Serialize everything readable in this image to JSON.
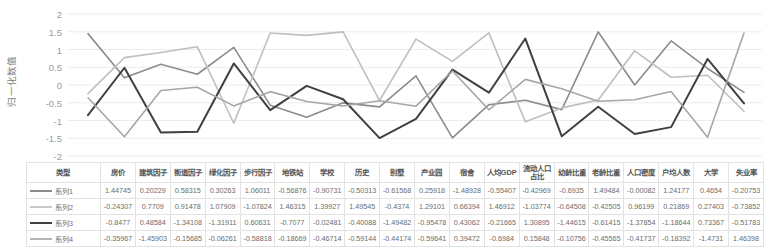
{
  "chart_data": {
    "type": "line",
    "title": "",
    "xlabel": "",
    "ylabel": "归一化数值",
    "ylim": [
      -2,
      2
    ],
    "yticks": [
      "2",
      "1.5",
      "1",
      "0.5",
      "0",
      "-0.5",
      "-1",
      "-1.5",
      "-2"
    ],
    "grid": true,
    "legend_position": "table",
    "categories": [
      "房价",
      "建筑因子",
      "街道因子",
      "绿化因子",
      "步行因子",
      "地铁站",
      "学校",
      "历史",
      "别墅",
      "产业园",
      "宿舍",
      "人均GDP",
      "流动人口占比",
      "幼龄比重",
      "老龄比重",
      "人口密度",
      "户均人数",
      "大学",
      "失业率"
    ],
    "series": [
      {
        "name": "系列1",
        "color": "#8c8c8c",
        "width": 1.6,
        "values": [
          1.44745,
          0.20229,
          0.58315,
          0.30263,
          1.06011,
          -0.56876,
          -0.90731,
          -0.50313,
          -0.61568,
          0.25918,
          -1.48928,
          -0.55407,
          -0.42969,
          -0.6935,
          1.49484,
          -0.00082,
          1.24177,
          0.4654,
          -0.20753
        ]
      },
      {
        "name": "系列2",
        "color": "#bfbfbf",
        "width": 1.6,
        "values": [
          -0.24307,
          0.7709,
          0.91478,
          1.07909,
          -1.07824,
          1.46315,
          1.39927,
          1.49545,
          -0.4374,
          1.29101,
          0.66394,
          1.46912,
          -1.03774,
          -0.64508,
          -0.42505,
          0.96199,
          0.21869,
          0.27403,
          -0.73852
        ]
      },
      {
        "name": "系列3",
        "color": "#404040",
        "width": 2.0,
        "values": [
          -0.8477,
          0.48584,
          -1.34108,
          -1.31911,
          0.60631,
          -0.7077,
          -0.02481,
          -0.40088,
          -1.49482,
          -0.95478,
          0.43062,
          -0.21665,
          1.30895,
          -1.44615,
          -0.61415,
          -1.37854,
          -1.18644,
          0.73367,
          -0.51783
        ]
      },
      {
        "name": "系列4",
        "color": "#a6a6a6",
        "width": 1.6,
        "values": [
          -0.35967,
          -1.45903,
          -0.15685,
          -0.06261,
          -0.58818,
          -0.18669,
          -0.46714,
          -0.59144,
          -0.44174,
          -0.59641,
          0.39472,
          -0.6984,
          0.15848,
          -0.10756,
          -0.45565,
          -0.41737,
          -0.18392,
          -1.4731,
          1.46398
        ]
      }
    ]
  },
  "table": {
    "type_header": "类型",
    "headers": [
      "房价",
      "建筑因子",
      "街道因子",
      "绿化因子",
      "步行因子",
      "地铁站",
      "学校",
      "历史",
      "别墅",
      "产业园",
      "宿舍",
      "人均GDP",
      "流动人口占比",
      "幼龄比重",
      "老龄比重",
      "人口密度",
      "户均人数",
      "大学",
      "失业率"
    ],
    "rows": [
      {
        "label": "系列1",
        "color": "#8c8c8c",
        "width": 2,
        "cells": [
          "1.44745",
          "0.20229",
          "0.58315",
          "0.30263",
          "1.06011",
          "-0.56876",
          "-0.90731",
          "-0.50313",
          "-0.61568",
          "0.25918",
          "-1.48928",
          "-0.55407",
          "-0.42969",
          "-0.6935",
          "1.49484",
          "-0.00082",
          "1.24177",
          "0.4654",
          "-0.20753"
        ]
      },
      {
        "label": "系列2",
        "color": "#c9c9c9",
        "width": 2,
        "cells": [
          "-0.24307",
          "0.7709",
          "0.91478",
          "1.07909",
          "-1.07824",
          "1.46315",
          "1.39927",
          "1.49545",
          "-0.4374",
          "1.29101",
          "0.66394",
          "1.46912",
          "-1.03774",
          "-0.64508",
          "-0.42505",
          "0.96199",
          "0.21869",
          "0.27403",
          "-0.73852"
        ]
      },
      {
        "label": "系列3",
        "color": "#404040",
        "width": 2.6,
        "cells": [
          "-0.8477",
          "0.48584",
          "-1.34108",
          "-1.31911",
          "0.60631",
          "-0.7077",
          "-0.02481",
          "-0.40088",
          "-1.49482",
          "-0.95478",
          "0.43062",
          "-0.21665",
          "1.30895",
          "-1.44615",
          "-0.61415",
          "-1.37854",
          "-1.18644",
          "0.73367",
          "-0.51783"
        ]
      },
      {
        "label": "系列4",
        "color": "#b5b5b5",
        "width": 2,
        "cells": [
          "-0.35967",
          "-1.45903",
          "-0.15685",
          "-0.06261",
          "-0.58818",
          "-0.18669",
          "-0.46714",
          "-0.59144",
          "-0.44174",
          "-0.59641",
          "0.39472",
          "-0.6984",
          "0.15848",
          "-0.10756",
          "-0.45565",
          "-0.41737",
          "-0.18392",
          "-1.4731",
          "1.46398"
        ]
      }
    ]
  }
}
